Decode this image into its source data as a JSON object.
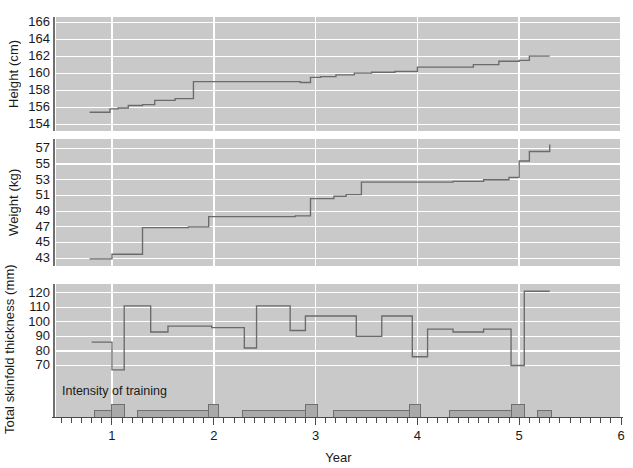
{
  "chart_data": {
    "type": "line",
    "title": "",
    "xlabel": "Year",
    "xlim": [
      0.45,
      6.0
    ],
    "xticks": [
      1,
      2,
      3,
      4,
      5,
      6
    ],
    "xticklabels": [
      "1",
      "2",
      "3",
      "4",
      "5",
      "6"
    ],
    "grid": true,
    "legend": "none",
    "annotations": [
      "Intensity of training"
    ],
    "panels": [
      {
        "name": "height",
        "ylabel": "Height (cm)",
        "ylim": [
          153.2,
          166.6
        ],
        "yticks": [
          154,
          156,
          158,
          160,
          162,
          164,
          166
        ],
        "yticklabels": [
          "154",
          "156",
          "158",
          "160",
          "162",
          "164",
          "166"
        ],
        "step_style": "post",
        "x": [
          0.78,
          0.9,
          0.98,
          1.06,
          1.16,
          1.3,
          1.42,
          1.62,
          1.8,
          1.95,
          2.05,
          2.3,
          2.6,
          2.85,
          2.95,
          3.05,
          3.2,
          3.38,
          3.55,
          3.78,
          4.0,
          4.25,
          4.55,
          4.8,
          5.0,
          5.1,
          5.3
        ],
        "y": [
          155.4,
          155.4,
          155.8,
          155.9,
          156.2,
          156.3,
          156.8,
          157.0,
          159.0,
          159.0,
          159.0,
          159.0,
          159.0,
          158.9,
          159.5,
          159.6,
          159.8,
          160.0,
          160.1,
          160.2,
          160.7,
          160.7,
          161.0,
          161.4,
          161.5,
          162.0,
          162.0
        ]
      },
      {
        "name": "weight",
        "ylabel": "Weight (kg)",
        "ylim": [
          42.0,
          58.2
        ],
        "yticks": [
          43,
          45,
          47,
          49,
          51,
          53,
          55,
          57
        ],
        "yticklabels": [
          "43",
          "45",
          "47",
          "49",
          "51",
          "53",
          "55",
          "57"
        ],
        "step_style": "post",
        "x": [
          0.78,
          0.92,
          1.0,
          1.1,
          1.3,
          1.58,
          1.75,
          1.95,
          2.1,
          2.45,
          2.8,
          2.95,
          3.05,
          3.18,
          3.3,
          3.45,
          3.7,
          4.0,
          4.35,
          4.65,
          4.9,
          5.0,
          5.1,
          5.3
        ],
        "y": [
          42.9,
          42.9,
          43.5,
          43.5,
          46.9,
          46.9,
          47.0,
          48.3,
          48.3,
          48.3,
          48.4,
          50.6,
          50.6,
          50.9,
          51.1,
          52.7,
          52.7,
          52.7,
          52.8,
          53.0,
          53.3,
          55.4,
          56.6,
          57.5
        ]
      },
      {
        "name": "skinfold",
        "ylabel": "Total skinfold thickness (mm)",
        "ylim": [
          60,
          126
        ],
        "yticks": [
          70,
          80,
          90,
          100,
          110,
          120
        ],
        "yticklabels": [
          "70",
          "80",
          "90",
          "100",
          "110",
          "120"
        ],
        "step_style": "post",
        "x": [
          0.8,
          0.98,
          1.0,
          1.1,
          1.12,
          1.35,
          1.38,
          1.52,
          1.55,
          1.95,
          1.98,
          2.28,
          2.3,
          2.4,
          2.42,
          2.72,
          2.75,
          2.88,
          2.9,
          3.12,
          3.15,
          3.38,
          3.4,
          3.62,
          3.65,
          3.92,
          3.95,
          4.08,
          4.1,
          4.32,
          4.35,
          4.62,
          4.65,
          4.9,
          4.92,
          5.02,
          5.05,
          5.3
        ],
        "y": [
          86,
          86,
          67,
          67,
          111,
          111,
          93,
          93,
          97,
          97,
          96,
          96,
          82,
          82,
          111,
          111,
          94,
          94,
          104,
          104,
          104,
          104,
          90,
          90,
          104,
          104,
          76,
          76,
          95,
          95,
          93,
          93,
          95,
          95,
          70,
          70,
          121,
          121
        ]
      }
    ],
    "intensity_bars": [
      {
        "x0": 0.83,
        "x1": 1.0,
        "level": 1
      },
      {
        "x0": 1.0,
        "x1": 1.12,
        "level": 2
      },
      {
        "x0": 1.25,
        "x1": 1.95,
        "level": 1
      },
      {
        "x0": 1.95,
        "x1": 2.05,
        "level": 2
      },
      {
        "x0": 2.28,
        "x1": 2.9,
        "level": 1
      },
      {
        "x0": 2.9,
        "x1": 3.02,
        "level": 2
      },
      {
        "x0": 3.18,
        "x1": 3.92,
        "level": 1
      },
      {
        "x0": 3.92,
        "x1": 4.03,
        "level": 2
      },
      {
        "x0": 4.32,
        "x1": 4.92,
        "level": 1
      },
      {
        "x0": 4.92,
        "x1": 5.05,
        "level": 2
      },
      {
        "x0": 5.18,
        "x1": 5.32,
        "level": 1
      }
    ]
  }
}
